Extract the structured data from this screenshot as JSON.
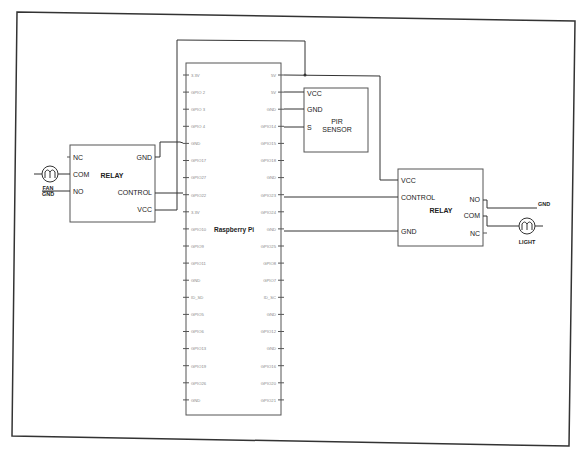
{
  "diagram": {
    "raspberry_pi": {
      "label": "Raspberry Pi",
      "left_pins": [
        "3.3V",
        "GPIO 2",
        "GPIO 3",
        "GPIO 4",
        "GND",
        "GPIO17",
        "GPIO27",
        "GPIO22",
        "3.3V",
        "GPIO10",
        "GPIO9",
        "GPIO11",
        "GND",
        "ID_SD",
        "GPIO5",
        "GPIO6",
        "GPIO13",
        "GPIO19",
        "GPIO26",
        "GND"
      ],
      "right_pins": [
        "5V",
        "5V",
        "GND",
        "GPIO14",
        "GPIO15",
        "GPIO18",
        "GND",
        "GPIO23",
        "GPIO24",
        "GND",
        "GPIO25",
        "GPIO8",
        "GPIO7",
        "ID_SC",
        "GND",
        "GPIO12",
        "GND",
        "GPIO16",
        "GPIO20",
        "GPIO21"
      ]
    },
    "pir_sensor": {
      "label_line1": "PIR",
      "label_line2": "SENSOR",
      "pins": [
        "VCC",
        "GND",
        "S"
      ]
    },
    "relay_left": {
      "label": "RELAY",
      "left_pins": [
        "NC",
        "COM",
        "NO"
      ],
      "right_pins": [
        "GND",
        "CONTROL",
        "VCC"
      ]
    },
    "relay_right": {
      "label": "RELAY",
      "left_pins": [
        "VCC",
        "CONTROL",
        "GND"
      ],
      "right_pins": [
        "NO",
        "COM",
        "NC"
      ]
    },
    "fan": {
      "label": "FAN",
      "gnd_label": "GND",
      "symbol": "motor-m"
    },
    "light": {
      "label": "LIGHT",
      "symbol": "motor-m"
    },
    "right_gnd_label": "GND",
    "colors": {
      "line": "#333333",
      "box": "#555555",
      "text": "#222222",
      "pin_text": "#888888"
    }
  }
}
